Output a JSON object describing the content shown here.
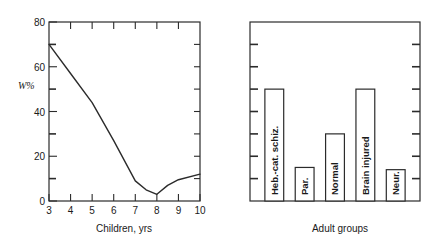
{
  "figure": {
    "panels": [
      "line-panel",
      "bar-panel"
    ]
  },
  "chart_data": [
    {
      "type": "line",
      "name": "children-line-chart",
      "title": "",
      "xlabel": "Children, yrs",
      "ylabel": "W%",
      "xlim": [
        3,
        10
      ],
      "ylim": [
        0,
        80
      ],
      "xticks": [
        3,
        4,
        5,
        6,
        7,
        8,
        9,
        10
      ],
      "xtick_labels": [
        "3",
        "4",
        "5",
        "6",
        "7",
        "8",
        "9",
        "10"
      ],
      "yticks": [
        0,
        20,
        40,
        60,
        80
      ],
      "ytick_labels": [
        "0",
        "20",
        "40",
        "60",
        "80"
      ],
      "yticks_minor": [
        10,
        30,
        50,
        70
      ],
      "grid": false,
      "legend": "none",
      "x": [
        3,
        4,
        5,
        6,
        7,
        7.5,
        8,
        8.5,
        9,
        10
      ],
      "values": [
        70,
        57,
        44,
        27,
        9,
        5,
        3,
        7,
        9.5,
        12
      ]
    },
    {
      "type": "bar",
      "name": "adult-groups-bar-chart",
      "title": "",
      "xlabel": "Adult groups",
      "ylabel": "",
      "ylim": [
        0,
        80
      ],
      "yticks_minor": [
        10,
        20,
        30,
        40,
        50,
        60,
        70
      ],
      "grid": false,
      "legend": "none",
      "categories": [
        "Heb.-cat. schiz.",
        "Par.",
        "Normal",
        "Brain injured",
        "Neur."
      ],
      "values": [
        50,
        15,
        30,
        50,
        14
      ]
    }
  ]
}
